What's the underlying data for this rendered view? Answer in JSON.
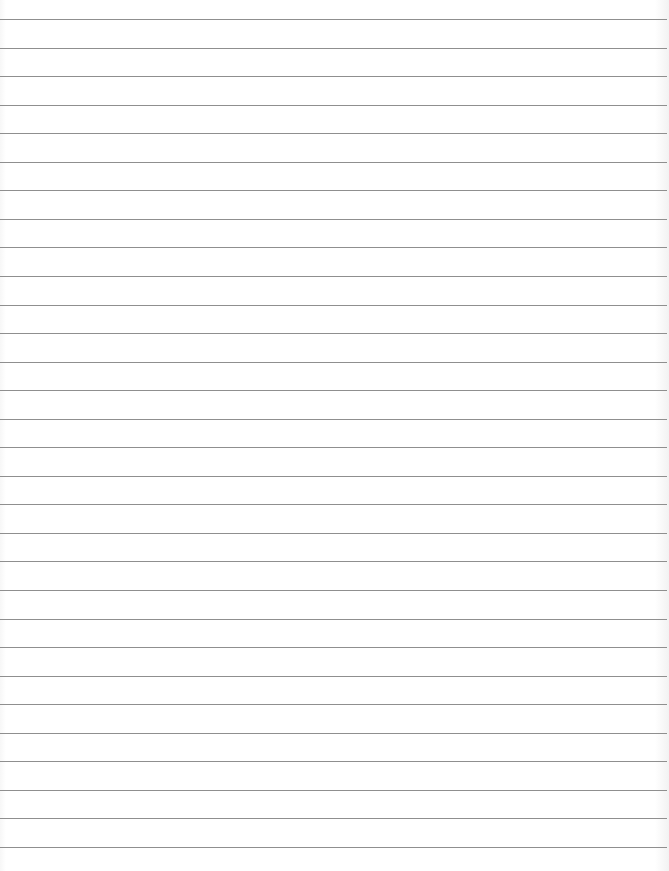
{
  "page": {
    "type": "lined-paper",
    "background_color": "#ffffff",
    "line_color": "#8f8f8f",
    "line_count": 30,
    "first_line_y": 19,
    "line_spacing": 28.55
  }
}
